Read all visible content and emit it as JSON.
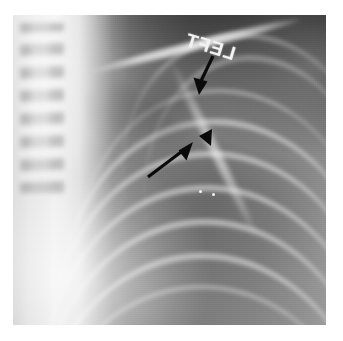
{
  "image": {
    "kind": "chest-radiograph",
    "modality_label": "X-ray",
    "view": "frontal chest, left hemithorax apex",
    "plate": {
      "x": 13,
      "y": 15,
      "width": 313,
      "height": 310
    },
    "page_background": "#ffffff",
    "plate_background": "#8e8e8e"
  },
  "markers": {
    "side_marker": {
      "text": "LEFT",
      "rendering": "mirrored",
      "rotation_deg": 17,
      "color": "#f2f2f2",
      "position": {
        "x": 238,
        "y": 44
      }
    }
  },
  "annotations": [
    {
      "name": "arrow-upper",
      "type": "arrow",
      "direction": "down-left",
      "color": "#0a0a0a",
      "tail": {
        "x": 213,
        "y": 56
      },
      "tip": {
        "x": 199,
        "y": 89
      },
      "points_at": "upper opacity margin"
    },
    {
      "name": "arrow-lower",
      "type": "arrow",
      "direction": "up-right",
      "color": "#0a0a0a",
      "tail": {
        "x": 148,
        "y": 175
      },
      "tip": {
        "x": 191,
        "y": 144
      },
      "points_at": "lower opacity margin"
    },
    {
      "name": "arrowhead-marker",
      "type": "arrowhead",
      "direction": "left",
      "color": "#0a0a0a",
      "tip": {
        "x": 199,
        "y": 136
      },
      "points_at": "fissure / pleural line"
    }
  ],
  "anatomy": [
    {
      "name": "vertebral-column",
      "region": "left midline",
      "appearance": "stacked vertebral bodies"
    },
    {
      "name": "trachea",
      "region": "left midline",
      "appearance": "bright vertical air column"
    },
    {
      "name": "clavicle",
      "region": "upper field",
      "appearance": "long bright oblique bar"
    },
    {
      "name": "scapula",
      "region": "right upper field",
      "appearance": "bright vertical edge"
    },
    {
      "name": "rib-arcs",
      "region": "right and lower field",
      "appearance": "repeating bright curved bands",
      "count": 9
    },
    {
      "name": "mediastinal-border",
      "region": "left",
      "appearance": "bright vertical band"
    },
    {
      "name": "heart-border",
      "region": "lower left",
      "appearance": "bright rounded bulge"
    },
    {
      "name": "lung-field",
      "region": "center right",
      "appearance": "dark aerated lung"
    },
    {
      "name": "opacity-lesion",
      "region": "upper center",
      "appearance": "ill-defined soft-tissue opacity"
    },
    {
      "name": "supraclavicular-background",
      "region": "upper right corner",
      "appearance": "near-black exposed film"
    }
  ],
  "ribs": [
    {
      "left": 52,
      "top": 74,
      "width": 300,
      "height": 180,
      "rot": -6,
      "class": "rib thin"
    },
    {
      "left": 38,
      "top": 104,
      "width": 320,
      "height": 190,
      "rot": -5,
      "class": "rib"
    },
    {
      "left": 30,
      "top": 136,
      "width": 330,
      "height": 196,
      "rot": -4,
      "class": "rib"
    },
    {
      "left": 24,
      "top": 170,
      "width": 336,
      "height": 200,
      "rot": -3,
      "class": "rib"
    },
    {
      "left": 20,
      "top": 204,
      "width": 340,
      "height": 204,
      "rot": -3,
      "class": "rib"
    },
    {
      "left": 16,
      "top": 238,
      "width": 344,
      "height": 206,
      "rot": -2,
      "class": "rib"
    },
    {
      "left": 14,
      "top": 270,
      "width": 346,
      "height": 206,
      "rot": -2,
      "class": "rib thin"
    },
    {
      "left": 120,
      "top": 40,
      "width": 230,
      "height": 150,
      "rot": -9,
      "class": "rib faint"
    },
    {
      "left": 96,
      "top": 18,
      "width": 250,
      "height": 140,
      "rot": -11,
      "class": "rib faint"
    }
  ],
  "specks": [
    {
      "x": 199,
      "y": 178
    },
    {
      "x": 186,
      "y": 175
    }
  ]
}
